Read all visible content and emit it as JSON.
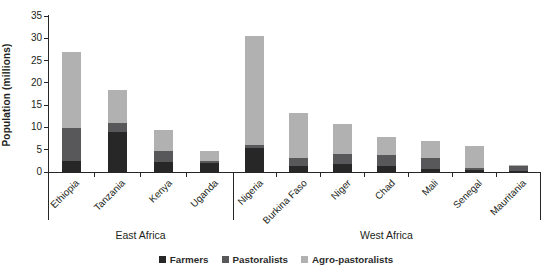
{
  "chart_data": {
    "type": "bar",
    "subtype": "stacked-grouped",
    "title": "",
    "ylabel": "Population (millions)",
    "xlabel": "",
    "ylim": [
      0,
      35
    ],
    "yticks": [
      0,
      5,
      10,
      15,
      20,
      25,
      30,
      35
    ],
    "grid": "off",
    "legend_position": "bottom",
    "categories": [
      "Ethiopia",
      "Tanzania",
      "Kenya",
      "Uganda",
      "Nigeria",
      "Burkina Faso",
      "Niger",
      "Chad",
      "Mali",
      "Senegal",
      "Mauritania"
    ],
    "groups": [
      {
        "label": "East Africa",
        "count": 4
      },
      {
        "label": "West Africa",
        "count": 7
      }
    ],
    "series": [
      {
        "name": "Farmers",
        "color": "#272727",
        "values": [
          2.5,
          8.9,
          2.2,
          2.0,
          5.3,
          1.4,
          1.9,
          1.3,
          0.7,
          0.5,
          0.3
        ]
      },
      {
        "name": "Pastoralists",
        "color": "#58585a",
        "values": [
          7.4,
          2.0,
          2.5,
          0.4,
          0.8,
          1.7,
          2.1,
          2.5,
          2.4,
          0.5,
          1.0
        ]
      },
      {
        "name": "Agro-pastoralists",
        "color": "#b1b1b1",
        "values": [
          17.1,
          7.4,
          4.8,
          2.3,
          24.5,
          10.1,
          6.8,
          4.0,
          3.9,
          4.8,
          0.3
        ]
      }
    ],
    "totals": [
      27.0,
      18.3,
      9.5,
      4.7,
      30.6,
      13.2,
      10.8,
      7.8,
      7.0,
      5.8,
      1.6
    ]
  }
}
